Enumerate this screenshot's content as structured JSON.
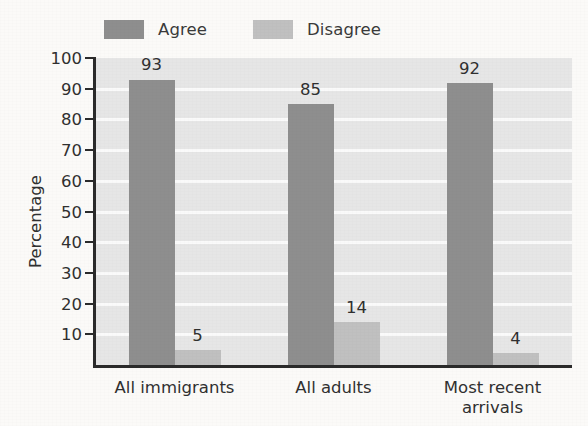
{
  "chart_data": {
    "type": "bar",
    "title": "",
    "subtitle": "",
    "xlabel": "",
    "ylabel": "Percentage",
    "ylim": [
      0,
      100
    ],
    "ytick_labels": [
      "10",
      "20",
      "30",
      "40",
      "50",
      "60",
      "70",
      "80",
      "90",
      "100"
    ],
    "ytick_values": [
      10,
      20,
      30,
      40,
      50,
      60,
      70,
      80,
      90,
      100
    ],
    "grid": "horizontal",
    "legend_position": "top-left",
    "categories": [
      "All immigrants",
      "All adults",
      "Most recent arrivals"
    ],
    "series": [
      {
        "name": "Agree",
        "color": "#8e8e8e",
        "values": [
          93,
          85,
          92
        ],
        "value_labels": [
          "93",
          "85",
          "92"
        ]
      },
      {
        "name": "Disagree",
        "color": "#c0c0c0",
        "values": [
          5,
          14,
          4
        ],
        "value_labels": [
          "5",
          "14",
          "4"
        ]
      }
    ]
  },
  "figure": {
    "plot_background_color": "#e6e6e6",
    "gridline_color": "#fafafa",
    "axis_color": "#2b2b2b",
    "page_background_color": "#fbfaf8",
    "text_color": "#303030"
  },
  "legend": {
    "entries": [
      {
        "label": "Agree",
        "swatch_color": "#8e8e8e"
      },
      {
        "label": "Disagree",
        "swatch_color": "#c0c0c0"
      }
    ]
  }
}
